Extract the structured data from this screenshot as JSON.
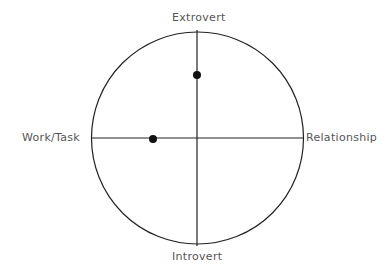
{
  "diagram": {
    "axes": {
      "top": "Extrovert",
      "bottom": "Introvert",
      "left": "Work/Task",
      "right": "Relationship"
    },
    "points": [
      {
        "name": "point-1",
        "cx": 197,
        "cy": 75
      },
      {
        "name": "point-2",
        "cx": 153,
        "cy": 139
      }
    ],
    "colors": {
      "line": "#222222",
      "point": "#111111",
      "label": "#555555"
    }
  }
}
